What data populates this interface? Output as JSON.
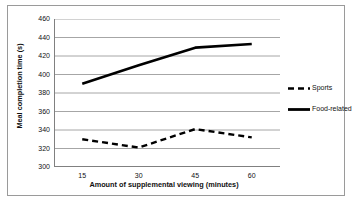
{
  "chart_data": {
    "type": "line",
    "title": "",
    "xlabel": "Amount of supplemental viewing (minutes)",
    "ylabel": "Meal completion time (s)",
    "categories": [
      "15",
      "30",
      "45",
      "60"
    ],
    "x": [
      15,
      30,
      45,
      60
    ],
    "ylim": [
      300,
      460
    ],
    "ytick_values": [
      300,
      320,
      340,
      360,
      380,
      400,
      420,
      440,
      460
    ],
    "ytick_labels": [
      "300",
      "320",
      "340",
      "360",
      "380",
      "400",
      "420",
      "440",
      "460"
    ],
    "xtick_labels": [
      "15",
      "30",
      "45",
      "60"
    ],
    "grid": "horizontal",
    "legend_position": "right",
    "series": [
      {
        "name": "Sports",
        "style": "dashed",
        "color": "#000000",
        "values": [
          330,
          321,
          341,
          332
        ]
      },
      {
        "name": "Food-related",
        "style": "solid",
        "color": "#000000",
        "values": [
          390,
          410,
          429,
          433
        ]
      }
    ],
    "colors": {
      "axis": "#808080",
      "grid": "#a6a6a6",
      "line": "#000000",
      "frame": "#9a9a9a",
      "text": "#111111",
      "background": "#ffffff"
    }
  },
  "legend": {
    "items": [
      {
        "label": "Sports",
        "style": "dashed"
      },
      {
        "label": "Food-related",
        "style": "solid"
      }
    ]
  }
}
